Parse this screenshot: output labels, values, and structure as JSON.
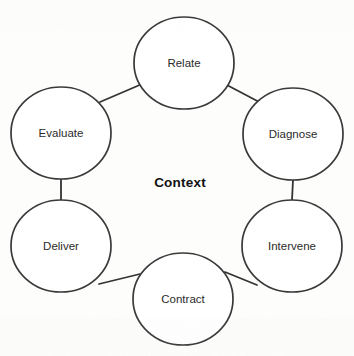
{
  "diagram": {
    "type": "cycle-diagram",
    "center_label": "Context",
    "background_color": "#fdfdfc",
    "stroke_color": "#333333",
    "label_color": "#2b2b2b",
    "node_fill": "#ffffff",
    "nodes": [
      {
        "id": "relate",
        "label": "Relate",
        "cx": 184,
        "cy": 63,
        "rx": 50,
        "ry": 46
      },
      {
        "id": "diagnose",
        "label": "Diagnose",
        "cx": 293,
        "cy": 134,
        "rx": 50,
        "ry": 46
      },
      {
        "id": "intervene",
        "label": "Intervene",
        "cx": 292,
        "cy": 246,
        "rx": 50,
        "ry": 46
      },
      {
        "id": "contract",
        "label": "Contract",
        "cx": 183,
        "cy": 299,
        "rx": 50,
        "ry": 46
      },
      {
        "id": "deliver",
        "label": "Deliver",
        "cx": 61,
        "cy": 246,
        "rx": 50,
        "ry": 46
      },
      {
        "id": "evaluate",
        "label": "Evaluate",
        "cx": 61,
        "cy": 133,
        "rx": 50,
        "ry": 46
      }
    ],
    "connectors": [
      {
        "id": "evaluate-relate",
        "from": "evaluate",
        "to": "relate",
        "x1": 100,
        "y1": 102,
        "x2": 142,
        "y2": 84
      },
      {
        "id": "relate-diagnose",
        "from": "relate",
        "to": "diagnose",
        "x1": 225,
        "y1": 84,
        "x2": 263,
        "y2": 104
      },
      {
        "id": "diagnose-intervene",
        "from": "diagnose",
        "to": "intervene",
        "x1": 293,
        "y1": 180,
        "x2": 292,
        "y2": 200
      },
      {
        "id": "intervene-contract",
        "from": "intervene",
        "to": "contract",
        "x1": 257,
        "y1": 285,
        "x2": 225,
        "y2": 272
      },
      {
        "id": "contract-deliver",
        "from": "contract",
        "to": "deliver",
        "x1": 140,
        "y1": 274,
        "x2": 99,
        "y2": 284
      },
      {
        "id": "deliver-evaluate",
        "from": "deliver",
        "to": "evaluate",
        "x1": 61,
        "y1": 200,
        "x2": 61,
        "y2": 179
      }
    ]
  }
}
